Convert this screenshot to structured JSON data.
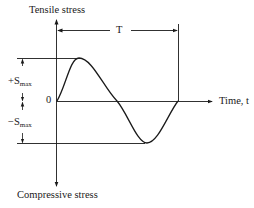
{
  "diagram": {
    "y_axis": {
      "top_label": "Tensile stress",
      "bottom_label": "Compressive stress"
    },
    "x_axis": {
      "label": "Time, t"
    },
    "origin_label": "0",
    "period_label": "T",
    "amplitude": {
      "positive_sign": "+S",
      "positive_sub": "max",
      "negative_sign": "−S",
      "negative_sub": "max"
    }
  }
}
